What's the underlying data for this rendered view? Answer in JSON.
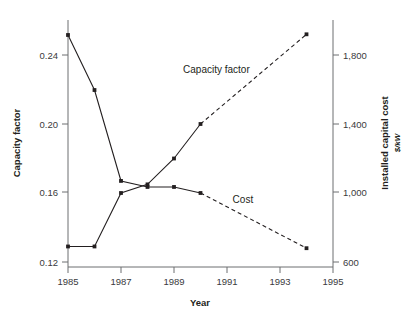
{
  "chart_data": {
    "type": "line",
    "title": "",
    "xlabel": "Year",
    "ylabel": "Capacity factor",
    "y2label": "Installed capital cost",
    "y2sublabel": "$/kW",
    "xlim": [
      1985,
      1995
    ],
    "ylim": [
      0.12,
      0.26
    ],
    "y2lim": [
      600,
      1916
    ],
    "grid": false,
    "legend_position": "inline-annotations",
    "xticks": [
      1985,
      1987,
      1989,
      1991,
      1993,
      1995
    ],
    "xtick_labels": [
      "1985",
      "1987",
      "1989",
      "1991",
      "1993",
      "1995"
    ],
    "yticks": [
      0.12,
      0.16,
      0.2,
      0.24
    ],
    "ytick_labels": [
      "0.12",
      "0.16",
      "0.20",
      "0.24"
    ],
    "y2ticks": [
      600,
      1000,
      1400,
      1800
    ],
    "y2tick_labels": [
      "600",
      "1,000",
      "1,400",
      "1,800"
    ],
    "series": [
      {
        "name": "Capacity factor",
        "axis": "left",
        "label_text": "Capacity factor",
        "label_x": 1990.6,
        "label_y": 0.2295,
        "solid_x": [
          1985,
          1986,
          1987,
          1988,
          1989,
          1990
        ],
        "solid_values": [
          0.129,
          0.129,
          0.16,
          0.165,
          0.18,
          0.2
        ],
        "dashed_x": [
          1990,
          1994
        ],
        "dashed_values": [
          0.2,
          0.252
        ]
      },
      {
        "name": "Cost",
        "axis": "right",
        "label_text": "Cost",
        "label_x": 1991.6,
        "label_y_right": 940,
        "solid_x": [
          1985,
          1986,
          1987,
          1988,
          1989,
          1990
        ],
        "solid_values": [
          1916,
          1597,
          1070,
          1035,
          1035,
          1000
        ],
        "dashed_x": [
          1990,
          1994
        ],
        "dashed_values": [
          1000,
          680
        ]
      }
    ],
    "colors": {
      "series": "#231f20",
      "axis": "#6d6e70",
      "background": "#ffffff"
    }
  }
}
